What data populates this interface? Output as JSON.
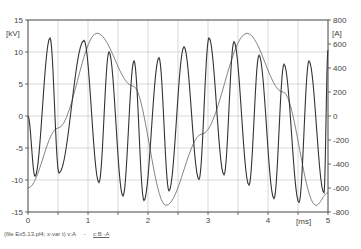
{
  "chart_data": {
    "type": "line",
    "title": "",
    "xlabel": "[ms]",
    "ylabel_left": "[kV]",
    "ylabel_right": "[A]",
    "xlim": [
      0,
      5
    ],
    "ylim_left": [
      -15,
      15
    ],
    "ylim_right": [
      -800,
      800
    ],
    "x_ticks": [
      "0",
      "1",
      "2",
      "3",
      "4",
      "5"
    ],
    "y_ticks_left": [
      "15",
      "10",
      "5",
      "0",
      "-5",
      "-10",
      "-15"
    ],
    "y_ticks_right": [
      "800",
      "600",
      "400",
      "200",
      "0",
      "-200",
      "-400",
      "-600",
      "-800"
    ],
    "grid": true,
    "legend_position": "bottom-left",
    "series": [
      {
        "name": "v:A",
        "axis": "left",
        "unit": "kV",
        "x": [
          0.0,
          0.117,
          0.367,
          0.517,
          0.933,
          1.183,
          1.35,
          1.583,
          1.767,
          1.933,
          2.183,
          2.35,
          2.6,
          2.85,
          3.017,
          3.267,
          3.433,
          3.683,
          3.85,
          4.1,
          4.267,
          4.517,
          4.683,
          4.933,
          5.0
        ],
        "values": [
          0.0,
          -9.4,
          12.2,
          -8.9,
          11.8,
          -10.4,
          10.0,
          -12.5,
          8.6,
          -13.2,
          9.1,
          -11.7,
          10.8,
          -9.9,
          12.2,
          -9.2,
          11.6,
          -10.8,
          9.5,
          -12.9,
          8.1,
          -13.5,
          8.6,
          -12.0,
          10.3
        ]
      },
      {
        "name": "c:B -A",
        "axis": "right",
        "unit": "A",
        "x": [
          0.0,
          0.5,
          1.15,
          1.75,
          2.3,
          2.9,
          3.65,
          4.25,
          4.8,
          5.0
        ],
        "values": [
          -600,
          -100,
          690,
          250,
          -745,
          -150,
          690,
          200,
          -745,
          -640
        ]
      }
    ]
  },
  "legend": {
    "file_info": "(file Ex5.13.pl4; x-var t)",
    "series_1": "v:A",
    "separator": "-",
    "series_2": "c:B  -A"
  }
}
